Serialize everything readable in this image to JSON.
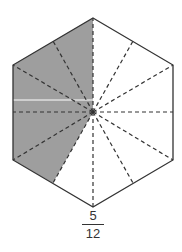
{
  "figure": {
    "shape": "regular hexagon",
    "divisions": 12,
    "shaded_parts": 5,
    "colors": {
      "shade": "#9e9e9e",
      "outline": "#333333",
      "dash": "#333333"
    }
  },
  "label": {
    "numerator": "5",
    "denominator": "12"
  }
}
